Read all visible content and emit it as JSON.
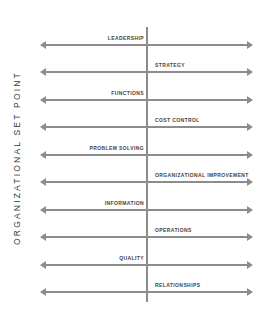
{
  "diagram": {
    "axis_label": "ORGANIZATIONAL SET POINT",
    "items": [
      {
        "label": "LEADERSHIP",
        "side": "left"
      },
      {
        "label": "STRATEGY",
        "side": "right"
      },
      {
        "label": "FUNCTIONS",
        "side": "left"
      },
      {
        "label": "COST CONTROL",
        "side": "right"
      },
      {
        "label": "PROBLEM SOLVING",
        "side": "left"
      },
      {
        "label": "ORGANIZATIONAL IMPROVEMENT",
        "side": "right"
      },
      {
        "label": "INFORMATION",
        "side": "left"
      },
      {
        "label": "OPERATIONS",
        "side": "right"
      },
      {
        "label": "QUALITY",
        "side": "left"
      },
      {
        "label": "RELATIONSHIPS",
        "side": "right"
      }
    ],
    "colors": {
      "line": "#8c8c8c",
      "text": "#444444"
    }
  }
}
